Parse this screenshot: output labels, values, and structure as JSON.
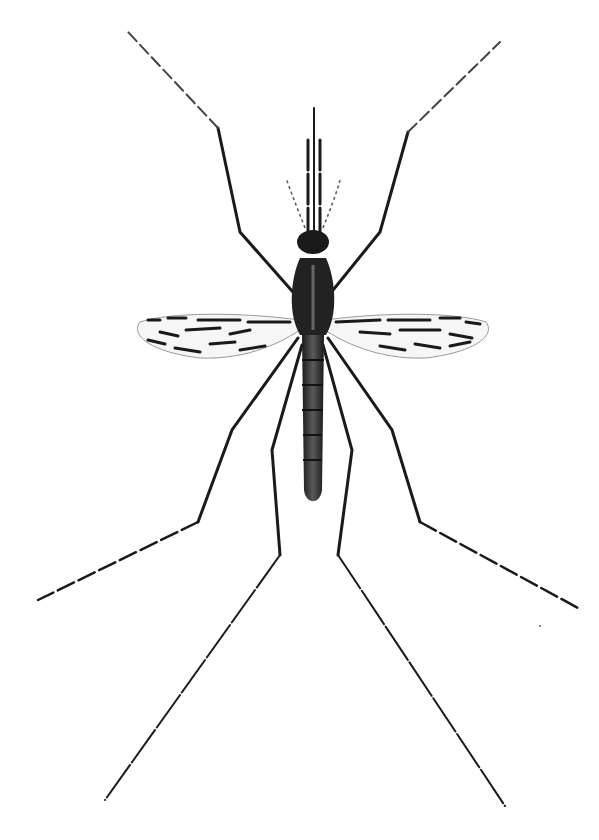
{
  "image": {
    "subject": "mosquito illustration",
    "style": "black ink scientific drawing on white",
    "colors": {
      "background": "#ffffff",
      "ink": "#1a1a1a",
      "body_mid": "#555555",
      "wing_shade": "#888888"
    }
  }
}
